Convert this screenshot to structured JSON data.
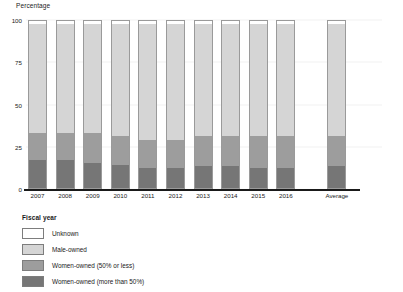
{
  "chart_data": {
    "type": "bar",
    "subtype": "stacked-percentage-column",
    "title": "",
    "xlabel": "Fiscal year",
    "ylabel": "Percentage",
    "ylim": [
      0,
      100
    ],
    "yticks": [
      0,
      25,
      50,
      75,
      100
    ],
    "ytick_labels": [
      "0",
      "25",
      "50",
      "75",
      "100"
    ],
    "grid": false,
    "legend_position": "bottom-left",
    "categories": [
      "2007",
      "2008",
      "2009",
      "2010",
      "2011",
      "2012",
      "2013",
      "2014",
      "2015",
      "2016",
      "Average"
    ],
    "series": [
      {
        "name": "Women-owned (more than 50%)",
        "color": "#767676",
        "values": [
          17,
          17,
          15,
          14,
          12,
          12,
          13,
          13,
          12,
          12,
          13
        ]
      },
      {
        "name": "Women-owned (50% or less)",
        "color": "#9d9d9d",
        "values": [
          16,
          16,
          18,
          17,
          17,
          17,
          18,
          18,
          19,
          19,
          18
        ]
      },
      {
        "name": "Male-owned",
        "color": "#d5d5d5",
        "values": [
          65,
          65,
          65,
          67,
          69,
          69,
          67,
          67,
          67,
          67,
          67
        ]
      },
      {
        "name": "Unknown",
        "color": "#ffffff",
        "values": [
          2,
          2,
          2,
          2,
          2,
          2,
          2,
          2,
          2,
          2,
          2
        ]
      }
    ]
  },
  "legend": {
    "items": [
      {
        "label": "Unknown",
        "color": "#ffffff"
      },
      {
        "label": "Male-owned",
        "color": "#d5d5d5"
      },
      {
        "label": "Women-owned (50% or less)",
        "color": "#9d9d9d"
      },
      {
        "label": "Women-owned (more than 50%)",
        "color": "#767676"
      }
    ]
  }
}
